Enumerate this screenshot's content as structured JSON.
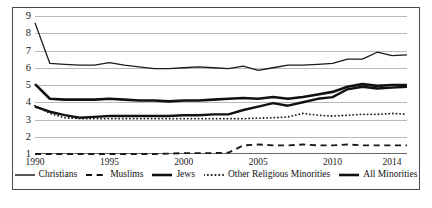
{
  "chart_data": {
    "type": "line",
    "title": "",
    "subtitle": "",
    "xlabel": "",
    "ylabel": "",
    "xlim": [
      1990,
      2015
    ],
    "ylim": [
      1,
      9
    ],
    "grid": true,
    "legend_position": "bottom",
    "y_ticks": [
      "1",
      "2",
      "3",
      "4",
      "5",
      "6",
      "7",
      "8",
      "9"
    ],
    "x_ticks": [
      "1990",
      "1995",
      "2000",
      "2005",
      "2010",
      "2014"
    ],
    "x_tick_values": [
      1990,
      1995,
      2000,
      2005,
      2010,
      2014
    ],
    "x": [
      1990,
      1991,
      1992,
      1993,
      1994,
      1995,
      1996,
      1997,
      1998,
      1999,
      2000,
      2001,
      2002,
      2003,
      2004,
      2005,
      2006,
      2007,
      2008,
      2009,
      2010,
      2011,
      2012,
      2013,
      2014,
      2015
    ],
    "series": [
      {
        "name": "Christians",
        "style": "thin-solid",
        "color": "#1a1a1a",
        "width": 1.3,
        "values": [
          8.6,
          6.25,
          6.2,
          6.15,
          6.15,
          6.3,
          6.15,
          6.05,
          5.95,
          5.95,
          6.0,
          6.05,
          6.0,
          5.95,
          6.1,
          5.85,
          6.0,
          6.15,
          6.15,
          6.2,
          6.25,
          6.5,
          6.5,
          6.9,
          6.7,
          6.75
        ]
      },
      {
        "name": "Muslims",
        "style": "dash-dot",
        "color": "#1a1a1a",
        "width": 1.9,
        "values": [
          1.0,
          1.0,
          1.0,
          1.0,
          1.0,
          1.0,
          1.0,
          1.0,
          1.0,
          1.02,
          1.05,
          1.05,
          1.05,
          1.08,
          1.5,
          1.55,
          1.5,
          1.5,
          1.55,
          1.5,
          1.5,
          1.55,
          1.5,
          1.5,
          1.5,
          1.5
        ]
      },
      {
        "name": "Jews",
        "style": "thick-solid",
        "color": "#111111",
        "width": 2.6,
        "values": [
          5.05,
          4.2,
          4.15,
          4.15,
          4.15,
          4.2,
          4.15,
          4.1,
          4.1,
          4.05,
          4.1,
          4.1,
          4.15,
          4.2,
          4.25,
          4.2,
          4.3,
          4.2,
          4.3,
          4.45,
          4.6,
          4.9,
          5.05,
          4.95,
          5.0,
          5.0
        ]
      },
      {
        "name": "Other Religious Minorities",
        "style": "dotted",
        "color": "#1a1a1a",
        "width": 1.8,
        "values": [
          3.8,
          3.35,
          3.1,
          3.05,
          3.05,
          3.05,
          3.05,
          3.05,
          3.05,
          3.05,
          3.05,
          3.05,
          3.05,
          3.05,
          3.05,
          3.08,
          3.1,
          3.15,
          3.35,
          3.25,
          3.2,
          3.25,
          3.3,
          3.3,
          3.35,
          3.3
        ]
      },
      {
        "name": "All Minorities",
        "style": "thick-solid",
        "color": "#111111",
        "width": 2.4,
        "values": [
          3.75,
          3.45,
          3.25,
          3.1,
          3.15,
          3.2,
          3.2,
          3.2,
          3.2,
          3.2,
          3.25,
          3.25,
          3.3,
          3.3,
          3.55,
          3.75,
          3.95,
          3.8,
          4.0,
          4.2,
          4.3,
          4.75,
          4.9,
          4.8,
          4.85,
          4.9
        ]
      }
    ]
  },
  "legend": {
    "items": [
      {
        "label": "Christians",
        "style": "thin-solid"
      },
      {
        "label": "Muslims",
        "style": "dash-dot"
      },
      {
        "label": "Jews",
        "style": "thick-solid"
      },
      {
        "label": "Other Religious Minorities",
        "style": "dotted"
      },
      {
        "label": "All Minorities",
        "style": "thick-solid"
      }
    ]
  }
}
